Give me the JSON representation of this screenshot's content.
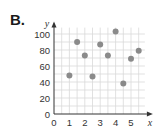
{
  "panel_label": "B.",
  "chart_data": {
    "type": "scatter",
    "title": "",
    "xlabel": "x",
    "ylabel": "y",
    "xlim": [
      0,
      5.8
    ],
    "ylim": [
      0,
      108
    ],
    "x_ticks": [
      "0",
      "1",
      "2",
      "3",
      "4",
      "5"
    ],
    "y_ticks": [
      "0",
      "20",
      "40",
      "60",
      "80",
      "100"
    ],
    "grid": true,
    "legend": null,
    "points": [
      {
        "x": 1,
        "y": 48
      },
      {
        "x": 1.5,
        "y": 90
      },
      {
        "x": 2,
        "y": 73
      },
      {
        "x": 2.5,
        "y": 47
      },
      {
        "x": 3,
        "y": 87
      },
      {
        "x": 3.5,
        "y": 73
      },
      {
        "x": 4,
        "y": 103
      },
      {
        "x": 4.5,
        "y": 38
      },
      {
        "x": 5,
        "y": 69
      },
      {
        "x": 5.5,
        "y": 79
      }
    ],
    "colors": {
      "point": "#8a8a8a",
      "grid": "#d9d9d9",
      "axis": "#333333"
    }
  }
}
